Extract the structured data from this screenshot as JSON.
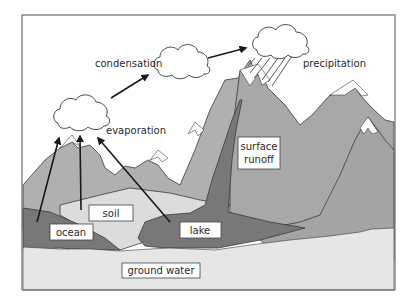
{
  "diagram": {
    "labels": {
      "condensation": "condensation",
      "precipitation": "precipitation",
      "evaporation": "evaporation",
      "surface_runoff_line1": "surface",
      "surface_runoff_line2": "runoff",
      "soil": "soil",
      "ocean": "ocean",
      "lake": "lake",
      "ground_water": "ground water"
    },
    "colors": {
      "frame": "#6e6e6e",
      "sky": "#ffffff",
      "mountain_light": "#b4b4b4",
      "mountain_mid": "#a6a6a6",
      "water_dark": "#7a7a7a",
      "soil": "#dedede",
      "ground_water": "#e8e8e8",
      "snow": "#ffffff",
      "arrow": "#1a1a1a"
    }
  }
}
